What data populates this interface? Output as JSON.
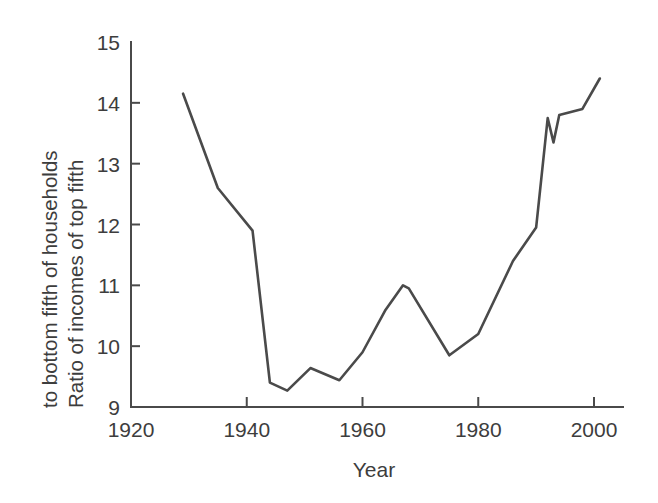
{
  "chart_data": {
    "type": "line",
    "title": "",
    "xlabel": "Year",
    "ylabel": "Ratio of incomes of top fifth to bottom fifth of households",
    "ylabel_line1": "Ratio of incomes of top fifth",
    "ylabel_line2": "to bottom fifth of households",
    "xlim": [
      1920,
      2005
    ],
    "ylim": [
      9,
      15
    ],
    "grid": false,
    "legend": "none",
    "line_color": "#4a4a4a",
    "xticks": [
      1920,
      1940,
      1960,
      1980,
      2000
    ],
    "xtick_labels": [
      "1920",
      "1940",
      "1960",
      "1980",
      "2000"
    ],
    "yticks": [
      9,
      10,
      11,
      12,
      13,
      14,
      15
    ],
    "ytick_labels": [
      "9",
      "10",
      "11",
      "12",
      "13",
      "14",
      "15"
    ],
    "series": [
      {
        "name": "Ratio of incomes of top fifth to bottom fifth of households",
        "x": [
          1929,
          1935,
          1941,
          1944,
          1947,
          1951,
          1956,
          1960,
          1964,
          1967,
          1968,
          1975,
          1980,
          1986,
          1990,
          1992,
          1993,
          1994,
          1996,
          1998,
          2001
        ],
        "values": [
          14.15,
          12.6,
          11.9,
          9.4,
          9.27,
          9.64,
          9.44,
          9.9,
          10.6,
          11.0,
          10.95,
          9.85,
          10.2,
          11.4,
          11.95,
          13.75,
          13.35,
          13.8,
          13.85,
          13.9,
          14.4
        ]
      }
    ]
  },
  "axes": {
    "x_axis_title": "Year",
    "y_axis_title_line1": "Ratio of incomes of top fifth",
    "y_axis_title_line2": "to bottom fifth of households"
  }
}
